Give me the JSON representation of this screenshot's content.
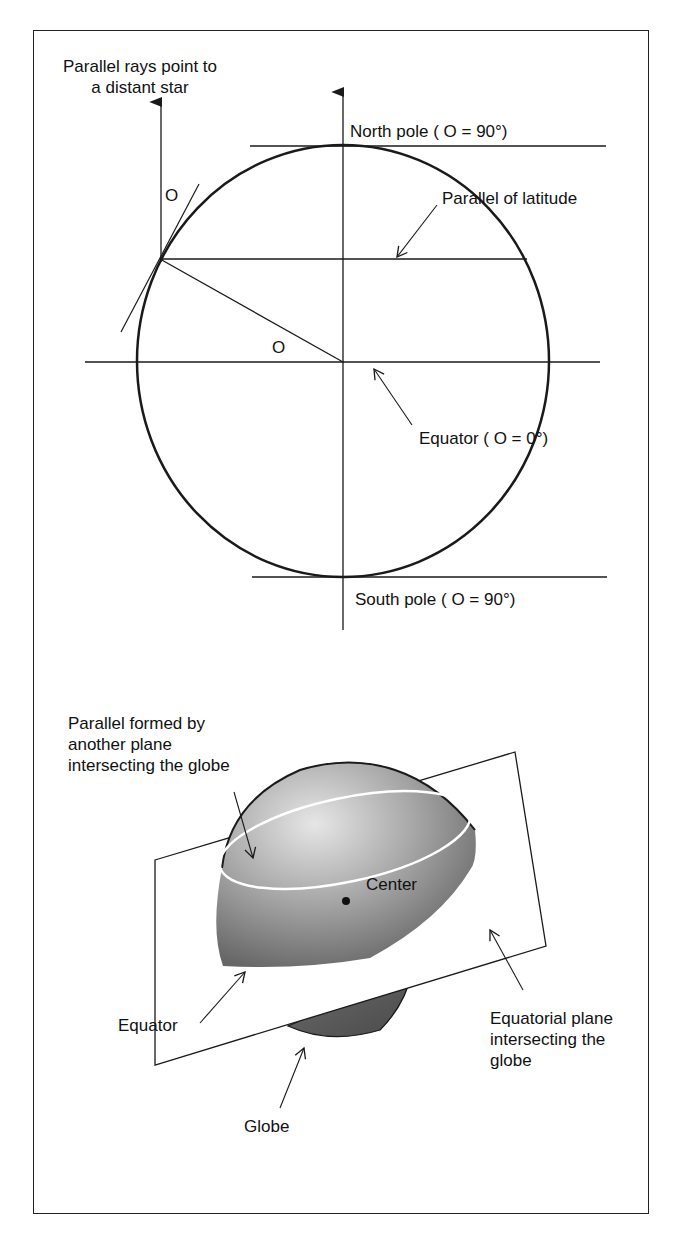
{
  "top_diagram": {
    "star_label_line1": "Parallel rays point to",
    "star_label_line2": "a distant star",
    "angle_symbol_tangent": "O",
    "angle_symbol_center": "O",
    "north_pole": "North pole ( O = 90°)",
    "parallel_of_latitude": "Parallel of latitude",
    "equator": "Equator ( O = 0°)",
    "south_pole": "South pole ( O = 90°)"
  },
  "bottom_diagram": {
    "parallel_formed_line1": "Parallel formed by",
    "parallel_formed_line2": "another plane",
    "parallel_formed_line3": "intersecting the globe",
    "center": "Center",
    "equator": "Equator",
    "equatorial_plane_line1": "Equatorial plane",
    "equatorial_plane_line2": "intersecting the",
    "equatorial_plane_line3": "globe",
    "globe": "Globe"
  },
  "colors": {
    "line": "#1a1a1a",
    "sphere_light": "#d8d8d8",
    "sphere_dark": "#6a6a6a",
    "lower_cap": "#5a5a5a"
  }
}
